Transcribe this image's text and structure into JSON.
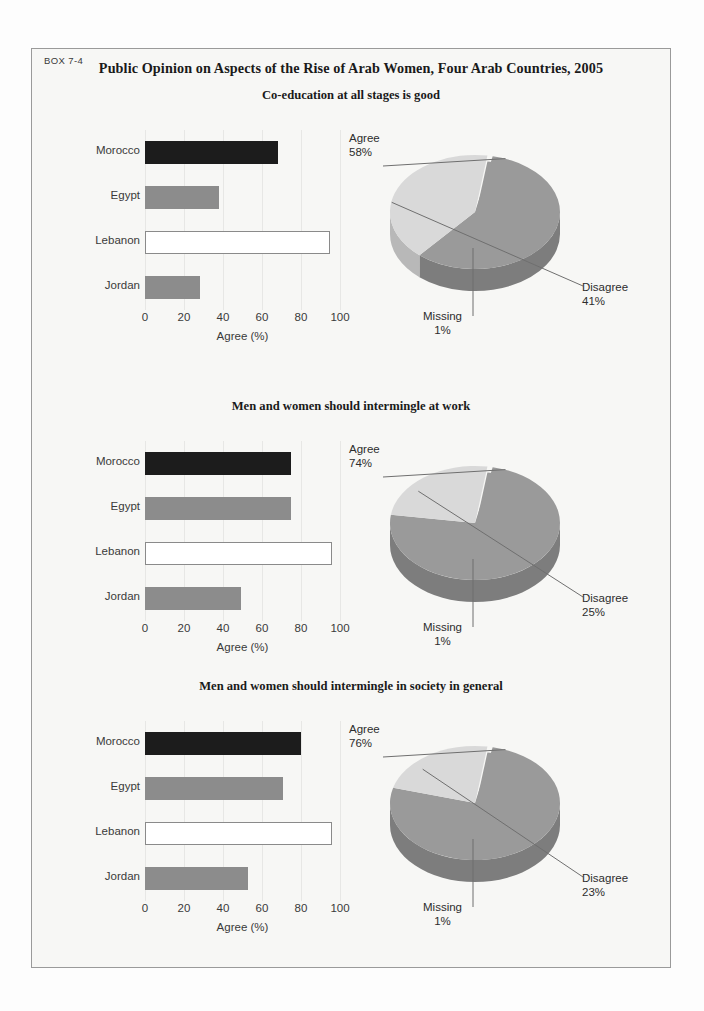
{
  "box": {
    "label": "BOX 7-4",
    "title": "Public Opinion on Aspects of the Rise of Arab Women, Four Arab Countries, 2005"
  },
  "colors": {
    "bar_morocco": "#1c1c1c",
    "bar_egypt": "#8c8c8c",
    "bar_lebanon": "#ffffff",
    "bar_jordan": "#8c8c8c",
    "pie_agree": "#9a9a9a",
    "pie_disagree": "#d9d9d9",
    "pie_side_dark": "#7d7d7d",
    "pie_side_light": "#b8b8b8",
    "box_border": "#9a9a9a",
    "panel_bg": "#f7f7f5",
    "gridline": "#e7e7e5",
    "text": "#3a3a3a"
  },
  "chart_data": [
    {
      "type": "bar",
      "title": "Co-education at all stages is good",
      "orientation": "horizontal",
      "categories": [
        "Morocco",
        "Egypt",
        "Lebanon",
        "Jordan"
      ],
      "values": [
        68,
        38,
        95,
        28
      ],
      "xlabel": "Agree (%)",
      "ylabel": "",
      "xlim": [
        0,
        100
      ],
      "xticks": [
        "0",
        "20",
        "40",
        "60",
        "80",
        "100"
      ],
      "grid": true,
      "legend": "none"
    },
    {
      "type": "pie",
      "title": "Co-education at all stages is good",
      "labels": [
        "Agree",
        "Disagree",
        "Missing"
      ],
      "values": [
        58,
        41,
        1
      ],
      "value_text": [
        "58%",
        "41%",
        "1%"
      ],
      "legend": "callout-labels",
      "style": "3d-exploded"
    },
    {
      "type": "bar",
      "title": "Men and women should intermingle at work",
      "orientation": "horizontal",
      "categories": [
        "Morocco",
        "Egypt",
        "Lebanon",
        "Jordan"
      ],
      "values": [
        75,
        75,
        96,
        49
      ],
      "xlabel": "Agree (%)",
      "ylabel": "",
      "xlim": [
        0,
        100
      ],
      "xticks": [
        "0",
        "20",
        "40",
        "60",
        "80",
        "100"
      ],
      "grid": true,
      "legend": "none"
    },
    {
      "type": "pie",
      "title": "Men and women should intermingle at work",
      "labels": [
        "Agree",
        "Disagree",
        "Missing"
      ],
      "values": [
        74,
        25,
        1
      ],
      "value_text": [
        "74%",
        "25%",
        "1%"
      ],
      "legend": "callout-labels",
      "style": "3d-exploded"
    },
    {
      "type": "bar",
      "title": "Men and women should intermingle in society in general",
      "orientation": "horizontal",
      "categories": [
        "Morocco",
        "Egypt",
        "Lebanon",
        "Jordan"
      ],
      "values": [
        80,
        71,
        96,
        53
      ],
      "xlabel": "Agree (%)",
      "ylabel": "",
      "xlim": [
        0,
        100
      ],
      "xticks": [
        "0",
        "20",
        "40",
        "60",
        "80",
        "100"
      ],
      "grid": true,
      "legend": "none"
    },
    {
      "type": "pie",
      "title": "Men and women should intermingle in society in general",
      "labels": [
        "Agree",
        "Disagree",
        "Missing"
      ],
      "values": [
        76,
        23,
        1
      ],
      "value_text": [
        "76%",
        "23%",
        "1%"
      ],
      "legend": "callout-labels",
      "style": "3d-exploded"
    }
  ],
  "panels": [
    {
      "title": "Co-education at all stages is good",
      "bar": {
        "categories": [
          "Morocco",
          "Egypt",
          "Lebanon",
          "Jordan"
        ],
        "values": [
          68,
          38,
          95,
          28
        ],
        "xlabel": "Agree (%)",
        "xticks": [
          "0",
          "20",
          "40",
          "60",
          "80",
          "100"
        ]
      },
      "pie": {
        "agree_label": "Agree",
        "agree_value": "58%",
        "disagree_label": "Disagree",
        "disagree_value": "41%",
        "missing_label": "Missing",
        "missing_value": "1%",
        "agree_pct": 58,
        "disagree_pct": 41,
        "missing_pct": 1
      }
    },
    {
      "title": "Men and women should intermingle at work",
      "bar": {
        "categories": [
          "Morocco",
          "Egypt",
          "Lebanon",
          "Jordan"
        ],
        "values": [
          75,
          75,
          96,
          49
        ],
        "xlabel": "Agree (%)",
        "xticks": [
          "0",
          "20",
          "40",
          "60",
          "80",
          "100"
        ]
      },
      "pie": {
        "agree_label": "Agree",
        "agree_value": "74%",
        "disagree_label": "Disagree",
        "disagree_value": "25%",
        "missing_label": "Missing",
        "missing_value": "1%",
        "agree_pct": 74,
        "disagree_pct": 25,
        "missing_pct": 1
      }
    },
    {
      "title": "Men and women should intermingle in society in general",
      "bar": {
        "categories": [
          "Morocco",
          "Egypt",
          "Lebanon",
          "Jordan"
        ],
        "values": [
          80,
          71,
          96,
          53
        ],
        "xlabel": "Agree (%)",
        "xticks": [
          "0",
          "20",
          "40",
          "60",
          "80",
          "100"
        ]
      },
      "pie": {
        "agree_label": "Agree",
        "agree_value": "76%",
        "disagree_label": "Disagree",
        "disagree_value": "23%",
        "missing_label": "Missing",
        "missing_value": "1%",
        "agree_pct": 76,
        "disagree_pct": 23,
        "missing_pct": 1
      }
    }
  ]
}
